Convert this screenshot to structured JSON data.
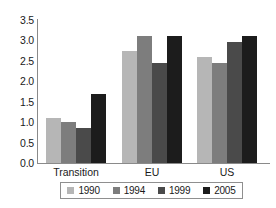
{
  "chart_data": {
    "type": "bar",
    "title": "",
    "subtitle": "",
    "xlabel": "",
    "ylabel": "",
    "categories": [
      "Transition",
      "EU",
      "US"
    ],
    "series": [
      {
        "name": "1990",
        "color": "#b6b6b6",
        "values": [
          1.1,
          2.75,
          2.6
        ]
      },
      {
        "name": "1994",
        "color": "#7d7d7d",
        "values": [
          1.0,
          3.1,
          2.45
        ]
      },
      {
        "name": "1999",
        "color": "#4a4a4a",
        "values": [
          0.85,
          2.45,
          2.95
        ]
      },
      {
        "name": "2005",
        "color": "#1c1c1c",
        "values": [
          1.7,
          3.1,
          3.1
        ]
      }
    ],
    "ylim": [
      0.0,
      3.5
    ],
    "ytick_labels": [
      "3.5",
      "3.0",
      "2.5",
      "2.0",
      "1.5",
      "1.0",
      "0.5",
      "0.0"
    ],
    "ytick_values": [
      3.5,
      3.0,
      2.5,
      2.0,
      1.5,
      1.0,
      0.5,
      0.0
    ],
    "grid": false,
    "legend_position": "bottom",
    "axis_color": "#8a8a8a"
  }
}
